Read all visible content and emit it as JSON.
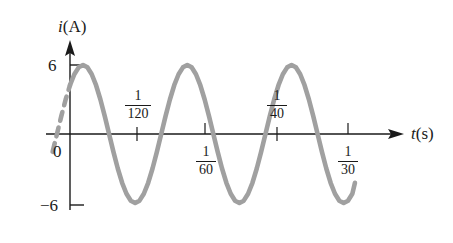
{
  "figure": {
    "kind": "sinusoidal-current-waveform-plot",
    "background_color": "#ffffff",
    "curve_color": "#a0a0a0",
    "axis_color": "#1a1a1a",
    "text_color": "#1a1a1a"
  },
  "axes": {
    "y_axis_label_var": "i",
    "y_axis_label_unit": "(A)",
    "x_axis_label_var": "t",
    "x_axis_label_unit": "(s)",
    "y_ticks": [
      {
        "label": "6",
        "value": 6
      },
      {
        "label": "0",
        "value": 0
      },
      {
        "label": "−6",
        "value": -6
      }
    ],
    "x_ticks": [
      {
        "numerator": "1",
        "denominator": "120",
        "value": 0.008333,
        "label_side": "above"
      },
      {
        "numerator": "1",
        "denominator": "60",
        "value": 0.016667,
        "label_side": "below"
      },
      {
        "numerator": "1",
        "denominator": "40",
        "value": 0.025,
        "label_side": "above"
      },
      {
        "numerator": "1",
        "denominator": "30",
        "value": 0.033333,
        "label_side": "below"
      }
    ]
  },
  "chart_data": {
    "type": "line",
    "title": "",
    "xlabel": "t(s)",
    "ylabel": "i(A)",
    "xlim": [
      0,
      0.0365
    ],
    "ylim": [
      -6,
      6
    ],
    "grid": false,
    "legend": null,
    "series": [
      {
        "name": "i(t)",
        "description": "Sinusoidal current, amplitude 6 A, period 1/60 s",
        "amplitude": 6,
        "period": 0.0166667,
        "frequency_hz": 60,
        "phase_deg": 45,
        "equation": "i = 6 sin(2π·60·t + 45°)",
        "style": "solid",
        "color": "#a0a0a0",
        "x": [
          0.0,
          0.000521,
          0.001042,
          0.001563,
          0.002083,
          0.002604,
          0.003125,
          0.003646,
          0.004167,
          0.004688,
          0.005208,
          0.005729,
          0.00625,
          0.006771,
          0.007292,
          0.007813,
          0.008333,
          0.008854,
          0.009375,
          0.009896,
          0.010417,
          0.010938,
          0.011458,
          0.011979,
          0.0125,
          0.013021,
          0.013542,
          0.014063,
          0.014583,
          0.015104,
          0.015625,
          0.016146,
          0.016667,
          0.017188,
          0.017708,
          0.018229,
          0.01875,
          0.019271,
          0.019792,
          0.020313,
          0.020833,
          0.021354,
          0.021875,
          0.022396,
          0.022917,
          0.023438,
          0.023958,
          0.024479,
          0.025,
          0.025521,
          0.026042,
          0.026563,
          0.027083,
          0.027604,
          0.028125,
          0.028646,
          0.029167,
          0.029688,
          0.030208,
          0.030729,
          0.03125,
          0.031771,
          0.032292,
          0.032813,
          0.033333,
          0.033854,
          0.034167
        ],
        "y": [
          4.243,
          5.196,
          5.796,
          6.0,
          5.796,
          5.196,
          4.243,
          3.0,
          1.553,
          0.0,
          -1.553,
          -3.0,
          -4.243,
          -5.196,
          -5.796,
          -6.0,
          -5.796,
          -5.196,
          -4.243,
          -3.0,
          -1.553,
          0.0,
          1.553,
          3.0,
          4.243,
          5.196,
          5.796,
          6.0,
          5.796,
          5.196,
          4.243,
          3.0,
          1.553,
          0.0,
          -1.553,
          -3.0,
          -4.243,
          -5.196,
          -5.796,
          -6.0,
          -5.796,
          -5.196,
          -4.243,
          -3.0,
          -1.553,
          0.0,
          1.553,
          3.0,
          4.243,
          5.196,
          5.796,
          6.0,
          5.796,
          5.196,
          4.243,
          3.0,
          1.553,
          0.0,
          -1.553,
          -3.0,
          -4.243,
          -5.196,
          -5.796,
          -6.0,
          -5.796,
          -5.196,
          -4.243
        ]
      },
      {
        "name": "i(t) extrapolated",
        "description": "Dashed extrapolation of the sinusoid back before t = 0",
        "style": "dashed",
        "color": "#a0a0a0",
        "x": [
          -0.0020833,
          -0.0015625,
          -0.0010417,
          -0.0005208,
          0.0
        ],
        "y": [
          -1.553,
          0.0,
          1.553,
          3.0,
          4.243
        ]
      }
    ],
    "annotations": [
      {
        "text": "6",
        "at_y": 6
      },
      {
        "text": "0",
        "at_y": 0
      },
      {
        "text": "−6",
        "at_y": -6
      },
      {
        "text": "1/120",
        "at_x": 0.008333
      },
      {
        "text": "1/60",
        "at_x": 0.016667
      },
      {
        "text": "1/40",
        "at_x": 0.025
      },
      {
        "text": "1/30",
        "at_x": 0.033333
      }
    ]
  }
}
